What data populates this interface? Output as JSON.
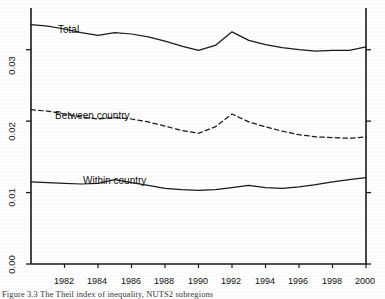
{
  "figure": {
    "caption": "Figure 3.3   The Theil index of inequality, NUTS2 subregions"
  },
  "chart_data": {
    "type": "line",
    "title": "",
    "xlabel": "",
    "ylabel": "",
    "xlim": [
      1980,
      2000
    ],
    "ylim": [
      0.0,
      0.035
    ],
    "grid": false,
    "legend": "inline-labels",
    "xticks": [
      1982,
      1984,
      1986,
      1988,
      1990,
      1992,
      1994,
      1996,
      1998,
      2000
    ],
    "xtick_labels": [
      "1982",
      "1984",
      "1986",
      "1988",
      "1990",
      "1992",
      "1994",
      "1996",
      "1998",
      "2000"
    ],
    "yticks": [
      0.0,
      0.01,
      0.02,
      0.03
    ],
    "ytick_labels": [
      "0.00",
      "0.01",
      "0.02",
      "0.03"
    ],
    "x": [
      1980,
      1981,
      1982,
      1983,
      1984,
      1985,
      1986,
      1987,
      1988,
      1989,
      1990,
      1991,
      1992,
      1993,
      1994,
      1995,
      1996,
      1997,
      1998,
      1999,
      2000
    ],
    "series": [
      {
        "name": "Total",
        "label": "Total",
        "style": "solid",
        "color": "#1a1a1a",
        "values": [
          0.0335,
          0.0333,
          0.0329,
          0.0324,
          0.032,
          0.0324,
          0.0322,
          0.0318,
          0.0312,
          0.0305,
          0.0299,
          0.0306,
          0.0325,
          0.0313,
          0.0307,
          0.0303,
          0.03,
          0.0298,
          0.0299,
          0.0299,
          0.0304
        ]
      },
      {
        "name": "Between country",
        "label": "Between country",
        "style": "dashed",
        "color": "#1a1a1a",
        "values": [
          0.0216,
          0.0214,
          0.021,
          0.0206,
          0.0203,
          0.0205,
          0.0203,
          0.0199,
          0.0193,
          0.0187,
          0.0183,
          0.0192,
          0.021,
          0.0199,
          0.0192,
          0.0186,
          0.0181,
          0.0178,
          0.0177,
          0.0176,
          0.0178
        ]
      },
      {
        "name": "Within country",
        "label": "Within country",
        "style": "solid",
        "color": "#1a1a1a",
        "values": [
          0.0115,
          0.0114,
          0.0113,
          0.0112,
          0.0113,
          0.0118,
          0.0114,
          0.011,
          0.0106,
          0.0104,
          0.0103,
          0.0104,
          0.0107,
          0.011,
          0.0107,
          0.0106,
          0.0108,
          0.0111,
          0.0115,
          0.0118,
          0.0121
        ]
      }
    ],
    "annotations": [
      {
        "text": "Total",
        "x": 1984.0,
        "y": 0.0337
      },
      {
        "text": "Between country",
        "x": 1985.4,
        "y": 0.0228
      },
      {
        "text": "Within country",
        "x": 1986.0,
        "y": 0.0133
      }
    ]
  }
}
